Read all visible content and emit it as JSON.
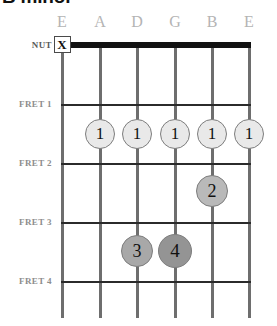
{
  "title": "B minor",
  "diagram": {
    "type": "guitar-chord-diagram",
    "nut_label": "NUT",
    "fret_labels": [
      "FRET 1",
      "FRET 2",
      "FRET 3",
      "FRET 4"
    ],
    "string_labels": [
      "E",
      "A",
      "D",
      "G",
      "B",
      "E"
    ],
    "string_x": [
      62,
      100,
      137,
      175,
      212,
      249
    ],
    "fret_y": [
      104,
      163,
      222,
      281
    ],
    "nut_y": 45,
    "colors": {
      "nut": "#111111",
      "fret_line": "#2b2b2b",
      "string": "#6e6e6e",
      "string_label": "#b4b4b4",
      "row_label": "#8d8d8d",
      "dot_light": "#e9e9e9",
      "dot_medium": "#b9b9b9",
      "dot_dark": "#a0a0a0",
      "dot_darker": "#919191",
      "dot_border": "#7d7d7d",
      "text": "#111111"
    },
    "mutes": [
      {
        "label": "X",
        "string_index": 0,
        "x": 62,
        "y": 45,
        "size": 17
      }
    ],
    "dots": [
      {
        "finger": "1",
        "string_index": 1,
        "fret": 1,
        "x": 100,
        "y": 134,
        "r": 15,
        "fill": "#e9e9e9",
        "font_size": 17
      },
      {
        "finger": "1",
        "string_index": 2,
        "fret": 1,
        "x": 137,
        "y": 134,
        "r": 15,
        "fill": "#e9e9e9",
        "font_size": 17
      },
      {
        "finger": "1",
        "string_index": 3,
        "fret": 1,
        "x": 175,
        "y": 134,
        "r": 15,
        "fill": "#e9e9e9",
        "font_size": 17
      },
      {
        "finger": "1",
        "string_index": 4,
        "fret": 1,
        "x": 212,
        "y": 134,
        "r": 15,
        "fill": "#e9e9e9",
        "font_size": 17
      },
      {
        "finger": "1",
        "string_index": 5,
        "fret": 1,
        "x": 249,
        "y": 134,
        "r": 15,
        "fill": "#e9e9e9",
        "font_size": 17
      },
      {
        "finger": "2",
        "string_index": 4,
        "fret": 2,
        "x": 212,
        "y": 191,
        "r": 16,
        "fill": "#b9b9b9",
        "font_size": 18
      },
      {
        "finger": "3",
        "string_index": 2,
        "fret": 3,
        "x": 137,
        "y": 251,
        "r": 16,
        "fill": "#a8a8a8",
        "font_size": 18
      },
      {
        "finger": "4",
        "string_index": 3,
        "fret": 3,
        "x": 175,
        "y": 251,
        "r": 17,
        "fill": "#949494",
        "font_size": 19
      }
    ]
  }
}
